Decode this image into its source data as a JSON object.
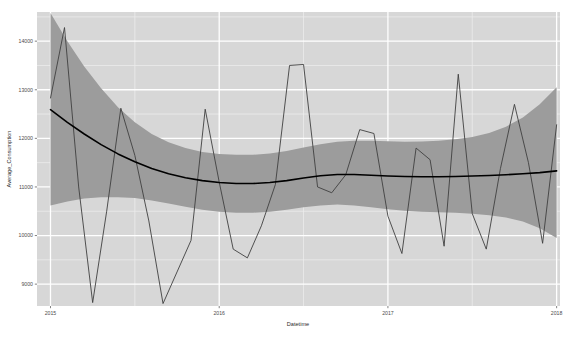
{
  "chart_data": {
    "type": "line",
    "title": "",
    "subtitle": "",
    "xlabel": "Datetime",
    "ylabel": "Average_Consumption",
    "xlim": [
      2014.92,
      2018.02
    ],
    "ylim": [
      8550,
      14600
    ],
    "grid": true,
    "legend": "none",
    "x_tick_labels": [
      "2015",
      "2016",
      "2017",
      "2018"
    ],
    "x_tick_values": [
      2015,
      2016,
      2017,
      2018
    ],
    "y_tick_labels": [
      "9000",
      "10000",
      "11000",
      "12000",
      "13000",
      "14000"
    ],
    "y_tick_values": [
      9000,
      10000,
      11000,
      12000,
      13000,
      14000
    ],
    "y_minor_values": [
      8500,
      9500,
      10500,
      11500,
      12500,
      13500,
      14500
    ],
    "x_minor_values": [
      2015.5,
      2016.5,
      2017.5
    ],
    "panel_background": "#d7d7d7",
    "major_grid_color": "#ffffff",
    "minor_grid_color": "#ececec",
    "series": [
      {
        "name": "Average_Consumption",
        "type": "line",
        "color": "#3f3f3f",
        "width": 0.9,
        "x": [
          2015.0,
          2015.083,
          2015.167,
          2015.25,
          2015.333,
          2015.417,
          2015.5,
          2015.583,
          2015.667,
          2015.75,
          2015.833,
          2015.917,
          2016.0,
          2016.083,
          2016.167,
          2016.25,
          2016.333,
          2016.417,
          2016.5,
          2016.583,
          2016.667,
          2016.75,
          2016.833,
          2016.917,
          2017.0,
          2017.083,
          2017.167,
          2017.25,
          2017.333,
          2017.417,
          2017.5,
          2017.583,
          2017.667,
          2017.75,
          2017.833,
          2017.917,
          2018.0
        ],
        "y": [
          12830,
          14280,
          11000,
          8620,
          10500,
          12620,
          11650,
          10300,
          8600,
          9250,
          9900,
          12600,
          11100,
          9720,
          9540,
          10200,
          11050,
          13500,
          13520,
          11000,
          10880,
          11250,
          12180,
          12100,
          10400,
          9630,
          11800,
          11560,
          9780,
          13320,
          10450,
          9720,
          11380,
          12700,
          11500,
          9840,
          12280
        ]
      },
      {
        "name": "smooth_fit",
        "type": "line",
        "color": "#000000",
        "width": 1.6,
        "x": [
          2015.0,
          2015.1,
          2015.2,
          2015.3,
          2015.4,
          2015.5,
          2015.6,
          2015.7,
          2015.8,
          2015.9,
          2016.0,
          2016.1,
          2016.2,
          2016.3,
          2016.4,
          2016.5,
          2016.6,
          2016.7,
          2016.8,
          2016.9,
          2017.0,
          2017.1,
          2017.2,
          2017.3,
          2017.4,
          2017.5,
          2017.6,
          2017.7,
          2017.8,
          2017.9,
          2018.0
        ],
        "y": [
          12590,
          12330,
          12090,
          11870,
          11680,
          11520,
          11380,
          11270,
          11190,
          11130,
          11090,
          11070,
          11070,
          11090,
          11130,
          11185,
          11230,
          11255,
          11255,
          11240,
          11225,
          11215,
          11210,
          11210,
          11215,
          11225,
          11235,
          11250,
          11270,
          11295,
          11330
        ]
      }
    ],
    "ribbon": {
      "name": "confidence_interval",
      "color": "#9c9c9c",
      "opacity": 1,
      "x": [
        2015.0,
        2015.1,
        2015.2,
        2015.3,
        2015.4,
        2015.5,
        2015.6,
        2015.7,
        2015.8,
        2015.9,
        2016.0,
        2016.1,
        2016.2,
        2016.3,
        2016.4,
        2016.5,
        2016.6,
        2016.7,
        2016.8,
        2016.9,
        2017.0,
        2017.1,
        2017.2,
        2017.3,
        2017.4,
        2017.5,
        2017.6,
        2017.7,
        2017.8,
        2017.9,
        2018.0
      ],
      "upper": [
        14580,
        14000,
        13480,
        13030,
        12640,
        12330,
        12090,
        11920,
        11800,
        11720,
        11680,
        11660,
        11660,
        11690,
        11740,
        11810,
        11880,
        11930,
        11950,
        11950,
        11940,
        11930,
        11935,
        11950,
        11980,
        12030,
        12110,
        12240,
        12430,
        12700,
        13050
      ],
      "lower": [
        10620,
        10700,
        10760,
        10790,
        10790,
        10770,
        10720,
        10660,
        10590,
        10530,
        10490,
        10470,
        10470,
        10490,
        10530,
        10580,
        10620,
        10640,
        10620,
        10580,
        10540,
        10510,
        10490,
        10480,
        10470,
        10450,
        10420,
        10370,
        10290,
        10150,
        9950
      ]
    }
  }
}
